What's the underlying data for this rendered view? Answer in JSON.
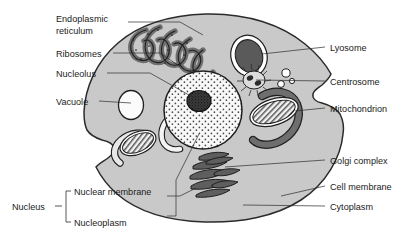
{
  "diagram": {
    "background_color": "#ffffff",
    "text_color": "#1a1a1a",
    "style": "black-and-white textbook line drawing with gray shading"
  },
  "colors": {
    "cytoplasm_fill": "#c9c9c9",
    "cell_outline": "#2b2b2b",
    "nucleus_fill": "#f7f7f7",
    "nucleolus_fill": "#3a3a3a",
    "organelle_dark": "#6e6e6e",
    "organelle_outline": "#2b2b2b",
    "vacuole_fill": "#fafafa",
    "lysosome_fill": "#5a5a5a",
    "leader_line": "#2b2b2b"
  },
  "labels": {
    "left": [
      {
        "id": "endoplasmic-reticulum",
        "text_line1": "Endoplasmic",
        "text_line2": "reticulum",
        "x": 56,
        "y": 18,
        "two_line": true
      },
      {
        "id": "ribosomes",
        "text_line1": "Ribosomes",
        "text_line2": "",
        "x": 56,
        "y": 56,
        "two_line": false
      },
      {
        "id": "nucleolus",
        "text_line1": "Nucleolus",
        "text_line2": "",
        "x": 56,
        "y": 76,
        "two_line": false
      },
      {
        "id": "vacuole",
        "text_line1": "Vacuole",
        "text_line2": "",
        "x": 56,
        "y": 104,
        "two_line": false
      }
    ],
    "right": [
      {
        "id": "lyosome",
        "text": "Lyosome",
        "x": 330,
        "y": 50
      },
      {
        "id": "centrosome",
        "text": "Centrosome",
        "x": 330,
        "y": 84
      },
      {
        "id": "mitochondrion",
        "text": "Mitochondrion",
        "x": 330,
        "y": 111
      },
      {
        "id": "golgi-complex",
        "text": "Golgi complex",
        "x": 330,
        "y": 163
      },
      {
        "id": "cell-membrane",
        "text": "Cell membrane",
        "x": 330,
        "y": 189
      },
      {
        "id": "cytoplasm",
        "text": "Cytoplasm",
        "x": 330,
        "y": 209
      }
    ],
    "bracket_group": {
      "id": "nucleus-group",
      "group_label": "Nucleus",
      "group_label_x": 22,
      "group_label_y": 209,
      "items": [
        {
          "id": "nuclear-membrane",
          "text": "Nuclear membrane",
          "x": 76,
          "y": 199
        },
        {
          "id": "nucleoplasm",
          "text": "Nucleoplasm",
          "x": 76,
          "y": 219
        }
      ]
    }
  },
  "organelles": [
    {
      "id": "cell-membrane",
      "name": "Cell membrane",
      "description": "outer boundary of the cell"
    },
    {
      "id": "cytoplasm",
      "name": "Cytoplasm",
      "description": "gray shaded interior filling"
    },
    {
      "id": "endoplasmic-reticulum",
      "name": "Endoplasmic reticulum",
      "description": "serpentine folded membrane network, upper left"
    },
    {
      "id": "ribosomes",
      "name": "Ribosomes",
      "description": "dots along the endoplasmic reticulum"
    },
    {
      "id": "nucleus",
      "name": "Nucleus",
      "description": "large stippled circle at center"
    },
    {
      "id": "nucleolus",
      "name": "Nucleolus",
      "description": "dark dense blob inside the nucleus"
    },
    {
      "id": "nuclear-membrane",
      "name": "Nuclear membrane",
      "description": "boundary circle of the nucleus"
    },
    {
      "id": "nucleoplasm",
      "name": "Nucleoplasm",
      "description": "stippled interior of the nucleus"
    },
    {
      "id": "vacuole",
      "name": "Vacuole",
      "description": "white oval on the left"
    },
    {
      "id": "lyosome",
      "name": "Lyosome",
      "description": "dark oval with white halo, upper right"
    },
    {
      "id": "centrosome",
      "name": "Centrosome",
      "description": "small starburst with two centrioles"
    },
    {
      "id": "mitochondrion",
      "name": "Mitochondrion",
      "description": "hatched ovals with cristae; two shown"
    },
    {
      "id": "golgi-complex",
      "name": "Golgi complex",
      "description": "stack of flattened dark sacs, lower center"
    }
  ]
}
